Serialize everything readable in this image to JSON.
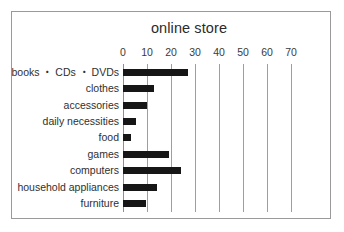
{
  "chart_data": {
    "type": "bar",
    "orientation": "horizontal",
    "title": "online store",
    "xlabel": "",
    "ylabel": "",
    "categories": [
      "books ・ CDs ・ DVDs",
      "clothes",
      "accessories",
      "daily necessities",
      "food",
      "games",
      "computers",
      "household appliances",
      "furniture"
    ],
    "values": [
      27,
      13,
      10,
      5.5,
      3.5,
      19,
      24,
      14,
      9.5
    ],
    "xticks": [
      0,
      10,
      20,
      30,
      40,
      50,
      60,
      70
    ],
    "xlim": [
      0,
      70
    ],
    "grid": true,
    "legend": false,
    "bar_color": "#161616",
    "gridline_color": "#9e9e9e",
    "background_color": "#ffffff",
    "frame_color": "#9a9a9a"
  }
}
